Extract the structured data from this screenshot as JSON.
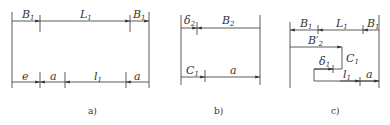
{
  "figures": [
    {
      "id": "a",
      "caption": "a)",
      "top_dims": [
        {
          "label": "B",
          "sub": "1"
        },
        {
          "label": "L",
          "sub": "1"
        },
        {
          "label": "B",
          "sub": "1"
        }
      ],
      "bottom_dims": [
        {
          "label": "e",
          "sub": ""
        },
        {
          "label": "a",
          "sub": ""
        },
        {
          "label": "l",
          "sub": "1"
        },
        {
          "label": "a",
          "sub": ""
        }
      ]
    },
    {
      "id": "b",
      "caption": "b)",
      "top_dims": [
        {
          "label": "δ",
          "sub": "2"
        },
        {
          "label": "B",
          "sub": "2"
        }
      ],
      "bottom_dims": [
        {
          "label": "C",
          "sub": "1"
        },
        {
          "label": "a",
          "sub": ""
        }
      ]
    },
    {
      "id": "c",
      "caption": "c)",
      "top_dims": [
        {
          "label": "B",
          "sub": "1"
        },
        {
          "label": "L",
          "sub": "1"
        },
        {
          "label": "B",
          "sub": "1"
        }
      ],
      "inner_dims": [
        {
          "label": "B′",
          "sub": "2"
        },
        {
          "label": "C",
          "sub": "1"
        },
        {
          "label": "δ",
          "sub": "1"
        },
        {
          "label": "l",
          "sub": "1"
        },
        {
          "label": "a",
          "sub": ""
        }
      ]
    }
  ]
}
